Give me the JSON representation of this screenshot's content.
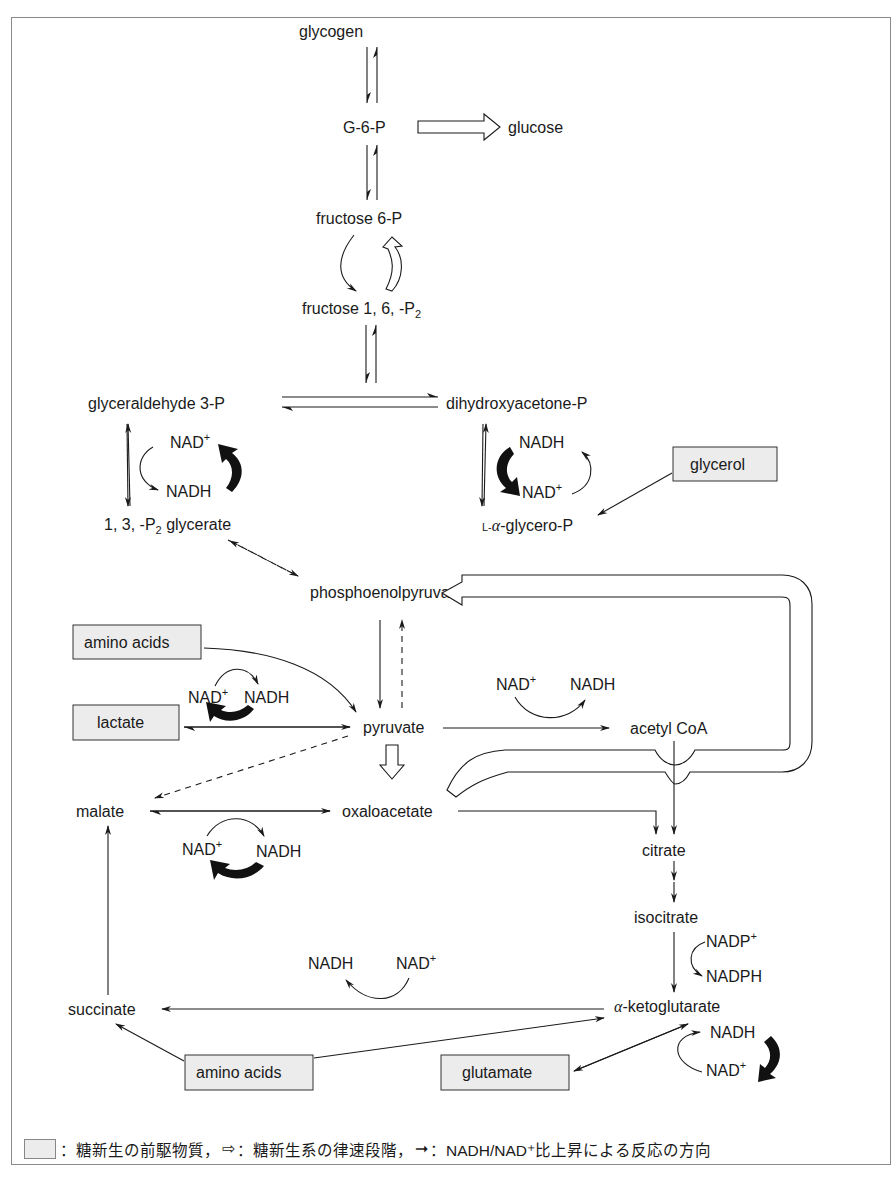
{
  "nodes": {
    "glycogen": "glycogen",
    "g6p": "G-6-P",
    "glucose": "glucose",
    "f6p": "fructose 6-P",
    "f16p2_main": "fructose 1, 6, -P",
    "f16p2_sub": "2",
    "g3p": "glyceraldehyde 3-P",
    "dhap": "dihydroxyacetone-P",
    "bpg_pre": "1, 3, -P",
    "bpg_sub": "2",
    "bpg_post": " glycerate",
    "glycerop_prefix": "L-",
    "glycerop_alpha": "α",
    "glycerop_suffix": "-glycero-P",
    "glycerol": "glycerol",
    "pep": "phosphoenolpyruvate",
    "amino_acids_top": "amino acids",
    "lactate": "lactate",
    "pyruvate": "pyruvate",
    "acetyl_coa": "acetyl CoA",
    "malate": "malate",
    "oxaloacetate": "oxaloacetate",
    "citrate": "citrate",
    "isocitrate": "isocitrate",
    "akg_alpha": "α",
    "akg_rest": "-ketoglutarate",
    "succinate": "succinate",
    "amino_acids_bottom": "amino acids",
    "glutamate": "glutamate"
  },
  "cofactors": {
    "nad": "NAD",
    "plus": "+",
    "nadh": "NADH",
    "nadp": "NADP",
    "nadph": "NADPH"
  },
  "legend": {
    "precursor": "：糖新生の前駆物質，",
    "rate_limiting_symbol": "⇨",
    "rate_limiting": "：糖新生系の律速段階，",
    "nadh_symbol": "➞",
    "nadh_direction": "：NADH/NAD⁺比上昇による反応の方向"
  },
  "colors": {
    "precursor_box": "#ececec",
    "line": "#1a1a1a",
    "frame": "#8a8a8a"
  }
}
